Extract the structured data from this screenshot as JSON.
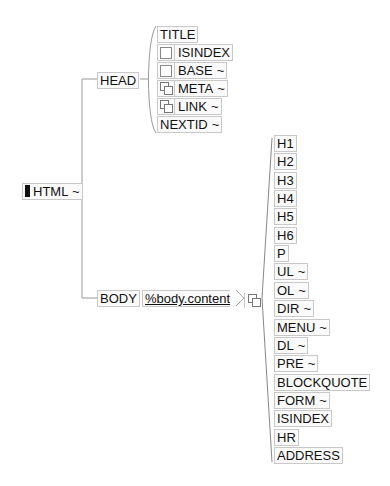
{
  "root": {
    "label": "HTML",
    "suffix": "~",
    "marker": "black-block"
  },
  "head": {
    "label": "HEAD",
    "children": [
      {
        "label": "TITLE",
        "icon": null,
        "suffix": ""
      },
      {
        "label": "ISINDEX",
        "icon": "optional-icon",
        "suffix": ""
      },
      {
        "label": "BASE",
        "icon": "optional-icon",
        "suffix": "~"
      },
      {
        "label": "META",
        "icon": "repeat-icon",
        "suffix": "~"
      },
      {
        "label": "LINK",
        "icon": "repeat-icon",
        "suffix": "~"
      },
      {
        "label": "NEXTID",
        "icon": null,
        "suffix": "~"
      }
    ]
  },
  "body": {
    "label": "BODY",
    "content_ref": "%body.content",
    "content_icon": "repeat-icon",
    "children": [
      {
        "label": "H1",
        "suffix": ""
      },
      {
        "label": "H2",
        "suffix": ""
      },
      {
        "label": "H3",
        "suffix": ""
      },
      {
        "label": "H4",
        "suffix": ""
      },
      {
        "label": "H5",
        "suffix": ""
      },
      {
        "label": "H6",
        "suffix": ""
      },
      {
        "label": "P",
        "suffix": ""
      },
      {
        "label": "UL",
        "suffix": "~"
      },
      {
        "label": "OL",
        "suffix": "~"
      },
      {
        "label": "DIR",
        "suffix": "~"
      },
      {
        "label": "MENU",
        "suffix": "~"
      },
      {
        "label": "DL",
        "suffix": "~"
      },
      {
        "label": "PRE",
        "suffix": "~"
      },
      {
        "label": "BLOCKQUOTE",
        "suffix": ""
      },
      {
        "label": "FORM",
        "suffix": "~"
      },
      {
        "label": "ISINDEX",
        "suffix": ""
      },
      {
        "label": "HR",
        "suffix": ""
      },
      {
        "label": "ADDRESS",
        "suffix": ""
      }
    ]
  }
}
